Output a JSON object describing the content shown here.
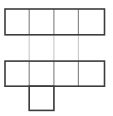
{
  "figure": {
    "kind": "geometric-net-diagram",
    "background_color": "#ffffff",
    "line_color": "#3c3c3c",
    "faint_line_color": "#c8c8c8",
    "mid_line_color": "#8a8a8a",
    "line_width": 1.6,
    "cell_size": 24.6,
    "canvas": {
      "width": 113,
      "height": 116
    }
  },
  "geometry": {
    "x_grid": [
      5,
      29.2,
      53.9,
      78.4,
      104.5
    ],
    "y_top_row": [
      9,
      34.8
    ],
    "y_middle_row": [
      61.1,
      86.2
    ],
    "y_bottom_row": [
      86.2,
      110.4
    ],
    "gap_rows": [
      34.8,
      61.1
    ]
  },
  "shapes": {
    "top_row": [
      {
        "name": "top-face-1",
        "x": 5,
        "y": 9,
        "w": 24.2,
        "h": 25.8
      },
      {
        "name": "top-face-2",
        "x": 29.2,
        "y": 9,
        "w": 24.7,
        "h": 25.8
      },
      {
        "name": "top-face-3",
        "x": 53.9,
        "y": 9,
        "w": 24.5,
        "h": 25.8
      },
      {
        "name": "top-face-4",
        "x": 78.4,
        "y": 9,
        "w": 26.1,
        "h": 25.8
      }
    ],
    "middle_row": [
      {
        "name": "middle-face-1",
        "x": 5,
        "y": 61.1,
        "w": 24.2,
        "h": 25.1
      },
      {
        "name": "middle-face-2",
        "x": 29.2,
        "y": 61.1,
        "w": 24.7,
        "h": 25.1
      },
      {
        "name": "middle-face-3",
        "x": 53.9,
        "y": 61.1,
        "w": 24.5,
        "h": 25.1
      },
      {
        "name": "middle-face-4",
        "x": 78.4,
        "y": 61.1,
        "w": 26.1,
        "h": 25.1
      }
    ],
    "bottom_row": [
      {
        "name": "bottom-face-1",
        "x": 29.2,
        "y": 86.2,
        "w": 24.7,
        "h": 24.2
      }
    ]
  },
  "ghost_segments": [
    {
      "name": "ghost-vertical-col2-gap",
      "x1": 29.2,
      "y1": 34.8,
      "x2": 29.2,
      "y2": 61.1
    },
    {
      "name": "ghost-vertical-col3-gap",
      "x1": 53.9,
      "y1": 34.8,
      "x2": 53.9,
      "y2": 61.1
    },
    {
      "name": "ghost-vertical-col4-gap",
      "x1": 78.4,
      "y1": 34.8,
      "x2": 78.4,
      "y2": 61.1
    },
    {
      "name": "ghost-vertical-col3-lower",
      "x1": 53.9,
      "y1": 86.2,
      "x2": 53.9,
      "y2": 110.4
    },
    {
      "name": "ghost-vertical-col2-lower",
      "x1": 29.2,
      "y1": 86.2,
      "x2": 29.2,
      "y2": 110.4
    }
  ]
}
